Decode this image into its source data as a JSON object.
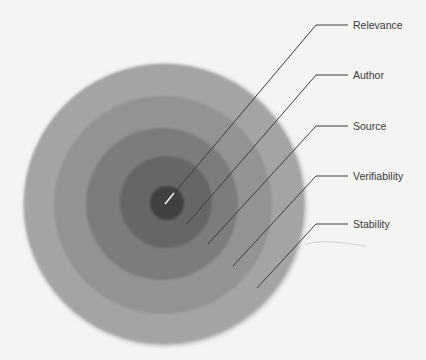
{
  "diagram": {
    "type": "concentric-layers",
    "background_color": "#f4f4f3",
    "layers": [
      {
        "id": "stability",
        "label": "Stability",
        "color": "#a4a4a4",
        "cx": 164,
        "cy": 204,
        "r": 140
      },
      {
        "id": "verifiability",
        "label": "Verifiability",
        "color": "#939393",
        "cx": 163,
        "cy": 205,
        "r": 109
      },
      {
        "id": "source",
        "label": "Source",
        "color": "#7b7b7b",
        "cx": 162,
        "cy": 204,
        "r": 76
      },
      {
        "id": "author",
        "label": "Author",
        "color": "#666666",
        "cx": 166,
        "cy": 202,
        "r": 46
      },
      {
        "id": "relevance",
        "label": "Relevance",
        "color": "#404040",
        "cx": 167,
        "cy": 203,
        "r": 17
      }
    ],
    "leaders": [
      {
        "layer": "relevance",
        "label": "Relevance",
        "x1": 165,
        "y1": 204,
        "ex": 316,
        "ey": 25,
        "x2": 348,
        "label_x": 353,
        "label_y": 19,
        "inner_segment_color": "#f2f2f2",
        "inner_segment_end_x": 174,
        "inner_segment_end_y": 193
      },
      {
        "layer": "author",
        "label": "Author",
        "x1": 187,
        "y1": 224,
        "ex": 316,
        "ey": 75,
        "x2": 348,
        "label_x": 353,
        "label_y": 69
      },
      {
        "layer": "source",
        "label": "Source",
        "x1": 208,
        "y1": 244,
        "ex": 316,
        "ey": 126,
        "x2": 348,
        "label_x": 353,
        "label_y": 120
      },
      {
        "layer": "verifiability",
        "label": "Verifiability",
        "x1": 233,
        "y1": 266,
        "ex": 316,
        "ey": 176,
        "x2": 348,
        "label_x": 353,
        "label_y": 170
      },
      {
        "layer": "stability",
        "label": "Stability",
        "x1": 257,
        "y1": 288,
        "ex": 316,
        "ey": 224,
        "x2": 348,
        "label_x": 353,
        "label_y": 218
      }
    ],
    "line_color": "#3c3c3c",
    "artifact_curve": "M305,245 Q318,238 365,246"
  },
  "labels": {
    "relevance": "Relevance",
    "author": "Author",
    "source": "Source",
    "verifiability": "Verifiability",
    "stability": "Stability"
  }
}
